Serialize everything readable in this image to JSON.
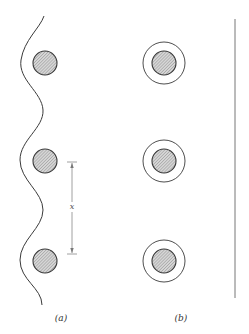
{
  "figure": {
    "panels": [
      {
        "id": "a",
        "label": "(a)",
        "label_pos": {
          "x": 61,
          "y": 313
        },
        "boundary": "wavy",
        "particles": [
          {
            "cx": 45,
            "cy": 63,
            "r": 12
          },
          {
            "cx": 45,
            "cy": 161,
            "r": 12
          },
          {
            "cx": 45,
            "cy": 261,
            "r": 12
          }
        ],
        "dimension": {
          "label": "x",
          "x": 72,
          "y_top": 162,
          "y_bottom": 254,
          "label_y": 207
        }
      },
      {
        "id": "b",
        "label": "(b)",
        "label_pos": {
          "x": 181,
          "y": 313
        },
        "boundary": "straight",
        "particles": [
          {
            "cx": 164,
            "cy": 63,
            "r": 12,
            "shell_r": 21
          },
          {
            "cx": 164,
            "cy": 161,
            "r": 12,
            "shell_r": 21
          },
          {
            "cx": 164,
            "cy": 261,
            "r": 12,
            "shell_r": 21
          }
        ],
        "wall": {
          "x": 235,
          "y_top": 19,
          "y_bottom": 298
        }
      }
    ],
    "colors": {
      "stroke": "#3a3a3a",
      "fill_hatch_bg": "#d8d8d8",
      "fill_hatch_line": "#8a8a8a",
      "wall": "#777777",
      "dimension": "#888888"
    }
  }
}
